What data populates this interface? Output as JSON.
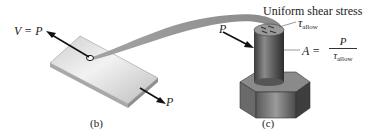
{
  "figure": {
    "panels": [
      {
        "id": "b",
        "caption": "(b)",
        "object": "plate with pin hole",
        "labels": {
          "shear_force": "V = P",
          "applied_force": "P"
        }
      },
      {
        "id": "c",
        "caption": "(c)",
        "object": "bolt (cylindrical shank on hexagonal head)",
        "labels": {
          "title": "Uniform shear stress",
          "tau_symbol": "τ",
          "tau_sub": "allow",
          "applied_force": "P",
          "area_lhs": "A =",
          "area_num": "P",
          "area_den_symbol": "τ",
          "area_den_sub": "allow"
        }
      }
    ],
    "colors": {
      "plate_light": "#e4e4e4",
      "plate_dark": "#9a9a9a",
      "ribbon": "#8c8c8c",
      "bolt_dark": "#4a4a4a",
      "bolt_mid": "#7a7a7a",
      "arrow": "#111111"
    }
  }
}
